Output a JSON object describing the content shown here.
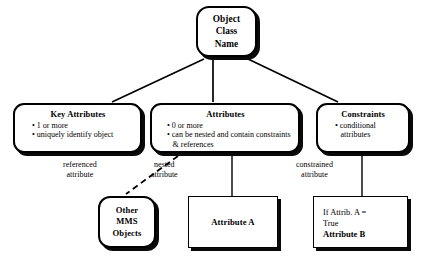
{
  "diagram": {
    "background_color": "#ffffff",
    "line_color": "#000000",
    "nodes": {
      "root": {
        "shape": "rounded-rect",
        "lines": [
          "Object",
          "Class",
          "Name"
        ]
      },
      "key_attributes": {
        "shape": "rounded-rect",
        "title": "Key Attributes",
        "bullets": [
          "1 or more",
          "uniquely identify object"
        ]
      },
      "attributes": {
        "shape": "rounded-rect",
        "title": "Attributes",
        "bullets": [
          "0 or more",
          "can be nested and contain constraints & references"
        ]
      },
      "constraints": {
        "shape": "rounded-rect",
        "title": "Constraints",
        "bullets": [
          "conditional attributes"
        ]
      },
      "other_mms_objects": {
        "shape": "rounded-rect",
        "lines": [
          "Other",
          "MMS",
          "Objects"
        ]
      },
      "attribute_a": {
        "shape": "rect",
        "title": "Attribute A"
      },
      "attribute_b": {
        "shape": "rect",
        "line_plain_1": "If Attrib. A =",
        "line_plain_2": "True",
        "line_bold": "Attribute B"
      }
    },
    "edge_labels": {
      "referenced": [
        "referenced",
        "attribute"
      ],
      "nested": [
        "nested",
        "attribute"
      ],
      "constrained": [
        "constrained",
        "attribute"
      ]
    },
    "bullet_glyph": "•"
  }
}
